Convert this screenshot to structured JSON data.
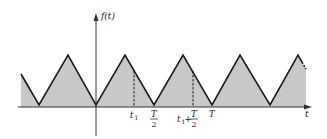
{
  "figure": {
    "type": "periodic-triangular-waveform",
    "function_label": "f(t)",
    "horizontal_axis_label": "t",
    "tick_labels": [
      {
        "id": "t1",
        "text": "t",
        "subscript": "1"
      },
      {
        "id": "T_half",
        "numerator": "T",
        "denominator": "2"
      },
      {
        "id": "t1_plus_T_half",
        "text": "t",
        "subscript": "1",
        "plus": "+",
        "numerator": "T",
        "denominator": "2"
      },
      {
        "id": "T",
        "text": "T"
      }
    ],
    "colors": {
      "fill": "#c8c8c8",
      "line": "#1a1a1a",
      "axis": "#333333",
      "background": "#ffffff"
    }
  }
}
